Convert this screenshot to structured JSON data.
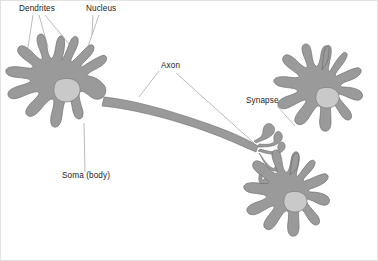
{
  "figure": {
    "width": 378,
    "height": 261,
    "background_color": "#ffffff",
    "frame_color": "#e2e2e2"
  },
  "colors": {
    "cell_fill": "#9a9a9a",
    "cell_outline": "#6f6f6f",
    "nucleus_fill": "#c9c9c9",
    "nucleus_outline": "#7e7e7e",
    "label_text": "#1a1a1a",
    "leader_line": "#9d9d9d"
  },
  "labels": [
    {
      "id": "dendrites",
      "text": "Dendrites",
      "x": 19,
      "y": 11
    },
    {
      "id": "nucleus",
      "text": "Nucleus",
      "x": 86,
      "y": 11
    },
    {
      "id": "axon",
      "text": "Axon",
      "x": 161,
      "y": 68
    },
    {
      "id": "synapse",
      "text": "Synapse",
      "x": 246,
      "y": 103
    },
    {
      "id": "soma",
      "text": "Soma (body)",
      "x": 62,
      "y": 178
    }
  ],
  "structures": [
    {
      "id": "presynaptic-neuron",
      "name": "Presynaptic neuron (left)",
      "parts": [
        "soma",
        "nucleus",
        "dendrites",
        "axon",
        "axon-terminal"
      ]
    },
    {
      "id": "postsynaptic-neuron-upper",
      "name": "Postsynaptic neuron (upper right)",
      "parts": [
        "soma",
        "nucleus",
        "dendrites"
      ]
    },
    {
      "id": "postsynaptic-neuron-lower",
      "name": "Postsynaptic neuron (lower right)",
      "parts": [
        "soma",
        "nucleus",
        "dendrites"
      ]
    }
  ],
  "annotations": {
    "dendrites_leader_count": 3,
    "nucleus_leader_count": 2,
    "axon_leader_count": 2,
    "synapse_leader_count": 1,
    "soma_leader_count": 1
  }
}
